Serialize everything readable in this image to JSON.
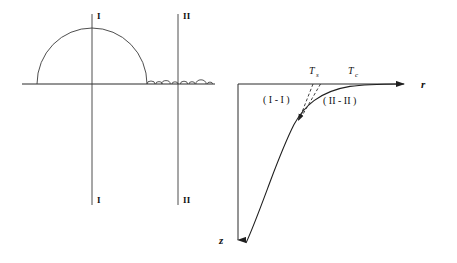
{
  "figure": {
    "background_color": "#ffffff",
    "line_color": "#2b2b2b",
    "width": 457,
    "height": 263
  },
  "left_panel": {
    "name": "ground-surface-profile",
    "baseline": {
      "x1": 22,
      "x2": 215,
      "y": 84
    },
    "dome": {
      "label": "large-semicircular-mound",
      "cx": 92,
      "rx": 55,
      "ry": 56,
      "base_y": 84
    },
    "small_bumps": [
      {
        "cx": 151,
        "rx": 4.0,
        "ry": 3.0
      },
      {
        "cx": 159,
        "rx": 3.2,
        "ry": 2.4
      },
      {
        "cx": 166,
        "rx": 4.2,
        "ry": 3.4
      },
      {
        "cx": 175,
        "rx": 3.0,
        "ry": 2.2
      },
      {
        "cx": 184,
        "rx": 3.6,
        "ry": 2.8
      },
      {
        "cx": 192,
        "rx": 3.0,
        "ry": 2.3
      },
      {
        "cx": 201,
        "rx": 5.2,
        "ry": 4.2
      },
      {
        "cx": 210,
        "rx": 2.6,
        "ry": 1.9
      }
    ],
    "section_lines": [
      {
        "id": "section-line-I",
        "x": 92,
        "y_top": 14,
        "y_bottom": 205,
        "top_label": "I",
        "bottom_label": "I"
      },
      {
        "id": "section-line-II",
        "x": 178,
        "y_top": 14,
        "y_bottom": 205,
        "top_label": "II",
        "bottom_label": "II"
      }
    ]
  },
  "right_panel": {
    "name": "temperature-depth-plot",
    "origin": {
      "x": 238,
      "y": 84
    },
    "r_axis": {
      "label": "r",
      "x_start": 238,
      "x_end": 412,
      "y": 84,
      "arrow": "right"
    },
    "z_axis": {
      "label": "z",
      "x": 238,
      "y_start": 84,
      "y_end": 248,
      "arrow": "down"
    },
    "markers": [
      {
        "id": "marker-Ts",
        "base": "T",
        "subscript": "s",
        "label_x": 311,
        "label_y": 72,
        "tick_x": 315
      },
      {
        "id": "marker-Tc",
        "base": "T",
        "subscript": "c",
        "label_x": 351,
        "label_y": 72,
        "tick_x": 353
      }
    ],
    "region_labels": [
      {
        "id": "region-I-I",
        "text": "( I - I )",
        "x": 268,
        "y": 102
      },
      {
        "id": "region-II-II",
        "text": "( II - II )",
        "x": 328,
        "y": 103
      }
    ],
    "profile_curve": {
      "id": "temperature-profile-curve",
      "description": "solid curve descending from Tc on the surface down-left into depth",
      "points": [
        [
          400,
          84
        ],
        [
          370,
          84.3
        ],
        [
          355,
          85
        ],
        [
          344,
          87
        ],
        [
          333,
          90
        ],
        [
          322,
          95
        ],
        [
          313,
          101
        ],
        [
          306,
          108
        ],
        [
          300,
          116
        ],
        [
          295,
          124
        ],
        [
          288,
          140
        ],
        [
          280,
          160
        ],
        [
          270,
          184
        ],
        [
          260,
          208
        ],
        [
          250,
          232
        ],
        [
          246,
          243
        ]
      ]
    },
    "dashed_lines": [
      {
        "id": "dashed-line-Ts-left",
        "from": [
          313,
          84
        ],
        "to": [
          301,
          116
        ]
      },
      {
        "id": "dashed-line-Ts-right",
        "from": [
          320,
          84
        ],
        "to": [
          303,
          115
        ]
      }
    ],
    "convergence_arrow": {
      "id": "convergence-arrowhead",
      "tip": [
        299,
        119
      ],
      "direction": "down-left"
    }
  }
}
